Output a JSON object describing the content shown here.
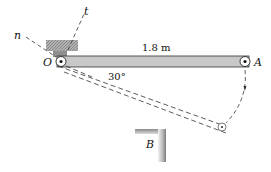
{
  "diagram": {
    "labels": {
      "n_axis": "n",
      "t_axis": "t",
      "pivot": "O",
      "end": "A",
      "obstacle": "B",
      "length": "1.8 m",
      "angle": "30°"
    },
    "colors": {
      "bar_fill": "#c8c8c8",
      "bar_edge": "#333333",
      "support_fill": "#a9a9a9",
      "line": "#333333"
    }
  }
}
